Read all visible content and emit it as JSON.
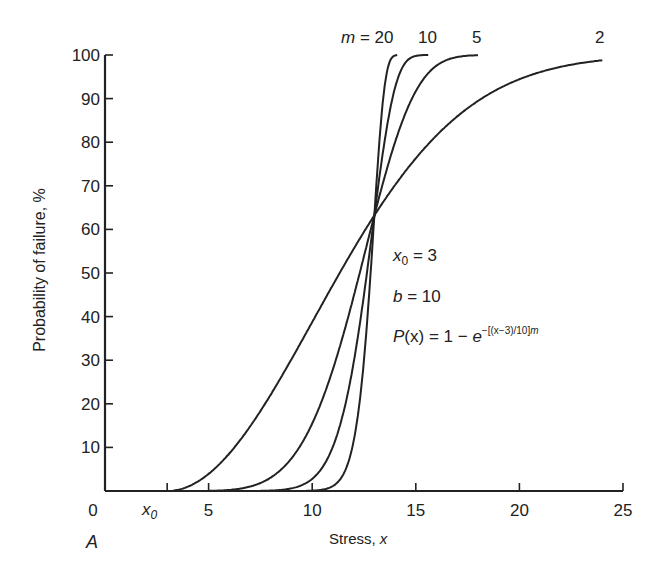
{
  "chart_data": {
    "type": "line",
    "title": "",
    "xlabel": "Stress, x",
    "ylabel": "Probability of failure, %",
    "xlim": [
      0,
      25
    ],
    "ylim": [
      0,
      100
    ],
    "x_ticks": [
      "0",
      "x0",
      "5",
      "10",
      "15",
      "20",
      "25"
    ],
    "x_tick_values": [
      0,
      3,
      5,
      10,
      15,
      20,
      25
    ],
    "y_ticks": [
      "10",
      "20",
      "30",
      "40",
      "50",
      "60",
      "70",
      "80",
      "90",
      "100"
    ],
    "grid": false,
    "legend": "inline curve labels at top",
    "parameters": {
      "x0": 3,
      "b": 10
    },
    "formula": "P(x) = 1 - e^-[(x-3)/10]^m",
    "x": [
      3,
      4,
      5,
      6,
      7,
      8,
      9,
      10,
      11,
      12,
      13,
      14,
      15,
      16,
      18,
      20,
      22,
      24
    ],
    "series": [
      {
        "name": "m = 2",
        "values": [
          0.0,
          1.0,
          3.9,
          8.6,
          14.8,
          22.1,
          30.2,
          38.7,
          47.3,
          55.5,
          63.2,
          70.2,
          76.3,
          81.5,
          89.5,
          94.4,
          97.3,
          98.8
        ]
      },
      {
        "name": "m = 5",
        "values": [
          0.0,
          0.0,
          0.0,
          0.2,
          1.0,
          3.1,
          7.5,
          15.5,
          28.0,
          44.6,
          63.2,
          80.0,
          91.7,
          97.7,
          100.0,
          100.0,
          100.0,
          100.0
        ]
      },
      {
        "name": "m = 10",
        "values": [
          0.0,
          0.0,
          0.0,
          0.0,
          0.0,
          0.1,
          0.6,
          2.8,
          10.2,
          29.5,
          63.2,
          92.6,
          99.8,
          100.0,
          100.0,
          100.0,
          100.0,
          100.0
        ]
      },
      {
        "name": "m = 20",
        "values": [
          0.0,
          0.0,
          0.0,
          0.0,
          0.0,
          0.0,
          0.0,
          0.1,
          1.2,
          11.5,
          63.2,
          99.5,
          100.0,
          100.0,
          100.0,
          100.0,
          100.0,
          100.0
        ]
      }
    ],
    "curve_labels": [
      "m = 20",
      "10",
      "5",
      "2"
    ],
    "annotations": [
      "x0 = 3",
      "b = 10",
      "P(x) = 1 − e^−[(x−3)/10]^m"
    ],
    "panel_label": "A"
  },
  "labels": {
    "m_prefix": "m",
    "m_eq": " = 20",
    "m10": "10",
    "m5": "5",
    "m2": "2",
    "x0_var": "x",
    "x0_sub": "0",
    "x0_val": " = 3",
    "b_var": "b",
    "b_val": " = 10",
    "p_lhs_P": "P",
    "p_lhs_rest": "(x) = 1 − ",
    "p_e": "e",
    "p_exp": "−[(x−3)/10]",
    "p_exp_m": "m",
    "panel": "A",
    "xlabel_text": "Stress, ",
    "xlabel_var": "x",
    "ylabel": "Probability of failure, %"
  }
}
